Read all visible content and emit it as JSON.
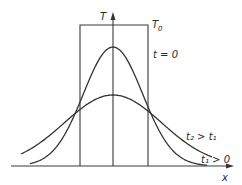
{
  "diagram": {
    "axes": {
      "y_label": "T",
      "x_label": "x"
    },
    "initial_profile": {
      "label": "T",
      "label_subscript": "0",
      "shape": "rectangle"
    },
    "curves": [
      {
        "name": "narrow",
        "label_main": "t",
        "label_rest": " = 0",
        "description": "t = 0 (early) narrow bell curve"
      },
      {
        "name": "broad",
        "label": "t2 > t1",
        "description": "later time, broad bell curve"
      }
    ],
    "labels": {
      "t0_label": "t = 0",
      "t2_gt_t1": "t₂ > t₁",
      "t1_gt_0": "t₁ > 0"
    },
    "geometry": {
      "baseline_y": 166,
      "center_x": 113,
      "rect": {
        "left": 80,
        "right": 148,
        "top": 25
      },
      "narrow": {
        "amplitude": 119,
        "sigma": 29.6,
        "x_from": 30,
        "x_to": 207
      },
      "broad": {
        "amplitude": 71,
        "sigma": 48.8,
        "x_from": 21,
        "x_to": 212
      }
    },
    "colors": {
      "ink": "#333333",
      "background": "#ffffff"
    }
  }
}
